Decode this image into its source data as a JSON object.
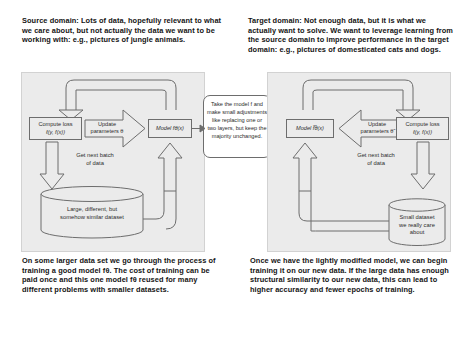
{
  "source": {
    "caption": "Source domain: Lots of data, hopefully relevant to what we care about, but not actually the data we want to be working with: e.g., pictures of jungle animals.",
    "footer": "On some larger data set we go through the process of training a good model fθ. The cost of training can be paid once and this one model fθ reused for many different problems with smaller datasets.",
    "loss_box_line1": "Compute loss",
    "loss_box_line2": "ℓ(y, f(x))",
    "update_arrow_line1": "Update",
    "update_arrow_line2": "parameters θ",
    "model_box": "Model fθ(x)",
    "batch_label": "Get next batch\nof data",
    "dataset_label": "Large, different, but\nsomehow similar dataset"
  },
  "target": {
    "caption": "Target domain: Not enough data, but it is what we actually want to solve. We want to leverage learning from the source domain to improve performance in the target domain: e.g., pictures of domesticated cats and dogs.",
    "footer": "Once we have the lightly modified model, we can begin training it on our new data. If the large data has enough structural similarity to our new data, this can lead to higher accuracy and fewer epochs of training.",
    "loss_box_line1": "Compute loss",
    "loss_box_line2": "ℓ(y, f(x))",
    "update_arrow_line1": "Update",
    "update_arrow_line2": "parameters θ̃",
    "model_box": "Model f̃θ̃(x)",
    "batch_label": "Get next batch\nof data",
    "dataset_label": "Small dataset\nwe really care\nabout"
  },
  "callout": {
    "text": "Take the model f and make small adjustments like replacing one or two layers, but keep the majority unchanged."
  },
  "colors": {
    "panel_fill": "#ebebeb",
    "stroke": "#6d6d6d",
    "text": "#2b2b2b",
    "caption_text": "#141414",
    "page_bg": "#ffffff"
  }
}
